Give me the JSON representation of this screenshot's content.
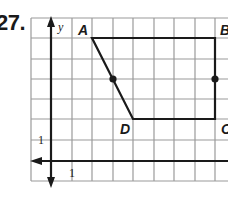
{
  "problem": {
    "number": "27."
  },
  "graph": {
    "axis_labels": {
      "y": "y"
    },
    "tick_labels": {
      "x": "1",
      "y": "1"
    },
    "vertices": [
      {
        "label": "A",
        "grid": [
          2,
          6
        ]
      },
      {
        "label": "B",
        "grid": [
          8,
          6
        ]
      },
      {
        "label": "C",
        "grid": [
          8,
          2
        ]
      },
      {
        "label": "D",
        "grid": [
          4,
          2
        ]
      }
    ],
    "midpoints": [
      {
        "of": "AD",
        "grid": [
          3,
          4
        ]
      },
      {
        "of": "BC",
        "grid": [
          8,
          4
        ]
      }
    ],
    "colors": {
      "grid": "#9a9a9a",
      "ink": "#1a1a1a",
      "background": "#ffffff"
    }
  }
}
